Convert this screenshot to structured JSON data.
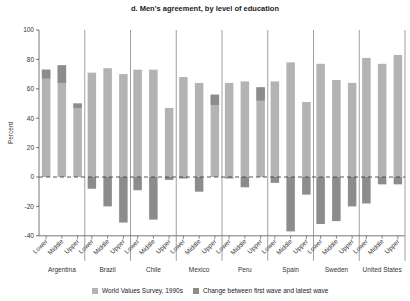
{
  "chart_data": {
    "type": "bar",
    "title": "d. Men's agreement, by level of education",
    "xlabel": "",
    "ylabel": "Percent",
    "ylim": [
      -40,
      100
    ],
    "yticks": [
      -40,
      -20,
      0,
      20,
      40,
      60,
      80,
      100
    ],
    "groups": [
      "Argentina",
      "Brazil",
      "Chile",
      "Mexico",
      "Peru",
      "Spain",
      "Sweden",
      "United States"
    ],
    "subcategories": [
      "Lower",
      "Middle",
      "Upper"
    ],
    "series": [
      {
        "name": "World Values Survey, 1990s",
        "color": "#b3b3b3",
        "values": [
          [
            73,
            76,
            50
          ],
          [
            71,
            74,
            70
          ],
          [
            73,
            73,
            47
          ],
          [
            68,
            64,
            56
          ],
          [
            64,
            65,
            61
          ],
          [
            65,
            78,
            51
          ],
          [
            77,
            66,
            64
          ],
          [
            81,
            77,
            83
          ]
        ]
      },
      {
        "name": "Change between first wave and latest wave",
        "color": "#8c8c8c",
        "values": [
          [
            6,
            12,
            3
          ],
          [
            -8,
            -20,
            -31
          ],
          [
            -9,
            -29,
            -2
          ],
          [
            -1,
            -10,
            7
          ],
          [
            -1,
            -7,
            9
          ],
          [
            -4,
            -37,
            -12
          ],
          [
            -32,
            -30,
            -20
          ],
          [
            -18,
            -5,
            -5
          ]
        ]
      }
    ],
    "legend_position": "bottom",
    "grid": false,
    "zero_line": "dashed"
  },
  "legend": {
    "items": [
      {
        "label": "World Values Survey, 1990s",
        "color": "#b3b3b3"
      },
      {
        "label": "Change between first wave and latest wave",
        "color": "#8c8c8c"
      }
    ]
  }
}
